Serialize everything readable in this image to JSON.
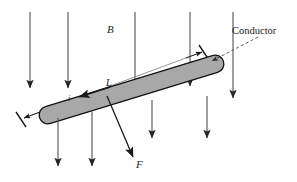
{
  "figure": {
    "background_color": "#ffffff",
    "width": 297,
    "height": 182
  },
  "labels": {
    "magnetic_field": "B",
    "length": "L",
    "current": "i",
    "force": "F",
    "conductor": "Conductor"
  },
  "colors": {
    "ink": "#1a1a1a",
    "field_line": "#595959",
    "rod_fill": "#a8a8a8",
    "rod_stroke": "#111111",
    "dimension_line": "#808080",
    "leader_line": "#555555"
  },
  "diagram": {
    "field_lines": [
      {
        "name": "field-line-1",
        "x": 30,
        "y1": 12,
        "y2": 90,
        "arrow": true
      },
      {
        "name": "field-line-2",
        "x": 68,
        "y1": 12,
        "y2": 90,
        "arrow": true
      },
      {
        "name": "field-line-3",
        "x": 135,
        "y1": 12,
        "y2": 98,
        "arrow": true
      },
      {
        "name": "field-line-4",
        "x": 190,
        "y1": 12,
        "y2": 88,
        "arrow": true
      },
      {
        "name": "field-line-5",
        "x": 233,
        "y1": 12,
        "y2": 100,
        "arrow": true
      }
    ],
    "field_lines_lower": [
      {
        "name": "field-line-lower-1",
        "x": 58,
        "y1": 120,
        "y2": 168,
        "arrow": true
      },
      {
        "name": "field-line-lower-2",
        "x": 92,
        "y1": 112,
        "y2": 168,
        "arrow": true
      },
      {
        "name": "field-line-lower-3",
        "x": 152,
        "y1": 100,
        "y2": 140,
        "arrow": true
      },
      {
        "name": "field-line-lower-4",
        "x": 207,
        "y1": 96,
        "y2": 140,
        "arrow": true
      }
    ],
    "rod": {
      "name": "conductor-rod",
      "x1": 46,
      "y1": 116,
      "x2": 217,
      "y2": 63,
      "thickness": 17
    },
    "dimension_L": {
      "name": "length-dimension",
      "x1": 22,
      "y1": 119,
      "x2": 203,
      "y2": 52
    },
    "current_arrow": {
      "name": "current-arrow",
      "x1": 108,
      "y1": 88,
      "x2": 78,
      "y2": 98
    },
    "force_arrow": {
      "name": "force-arrow",
      "x1": 107,
      "y1": 97,
      "x2": 134,
      "y2": 158
    },
    "conductor_leader": {
      "name": "conductor-leader-line",
      "x1": 253,
      "y1": 38,
      "x2": 210,
      "y2": 61
    }
  }
}
